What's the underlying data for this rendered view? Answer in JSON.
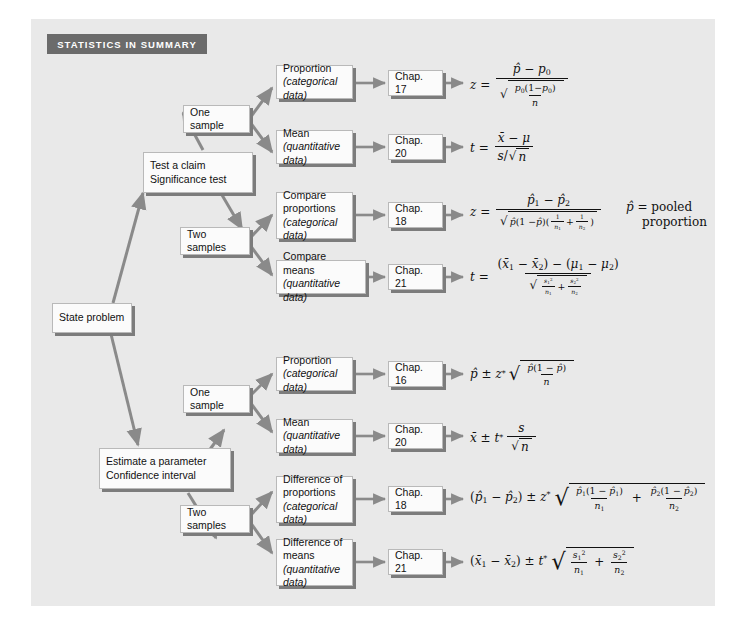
{
  "page": {
    "header_label": "STATISTICS IN SUMMARY",
    "panel_color": "#e9e9e9",
    "header_color": "#6b6b6b",
    "box_color": "#fbfbfb",
    "shadow_color": "#7c7c7c",
    "arrow_color": "#8a8a8a"
  },
  "nodes": {
    "start": {
      "line1": "State problem"
    },
    "branch_test": {
      "line1": "Test a claim",
      "line2": "Significance test"
    },
    "branch_estimate": {
      "line1": "Estimate a parameter",
      "line2": "Confidence interval"
    },
    "test_one_sample": {
      "line1": "One sample"
    },
    "test_two_samples": {
      "line1": "Two samples"
    },
    "est_one_sample": {
      "line1": "One sample"
    },
    "est_two_samples": {
      "line1": "Two samples"
    }
  },
  "rows": [
    {
      "id": "test-one-proportion",
      "label_line1": "Proportion",
      "label_line2": "(categorical data)",
      "chapter": "Chap. 17"
    },
    {
      "id": "test-one-mean",
      "label_line1": "Mean",
      "label_line2": "(quantitative data)",
      "chapter": "Chap. 20"
    },
    {
      "id": "test-two-proportions",
      "label_line1": "Compare",
      "label_line2": "proportions",
      "label_line3": "(categorical data)",
      "chapter": "Chap. 18"
    },
    {
      "id": "test-two-means",
      "label_line1": "Compare means",
      "label_line2": "(quantitative data)",
      "chapter": "Chap. 21"
    },
    {
      "id": "est-one-proportion",
      "label_line1": "Proportion",
      "label_line2": "(categorical data)",
      "chapter": "Chap. 16"
    },
    {
      "id": "est-one-mean",
      "label_line1": "Mean",
      "label_line2": "(quantitative data)",
      "chapter": "Chap. 20"
    },
    {
      "id": "est-two-proportions",
      "label_line1": "Difference of",
      "label_line2": "proportions",
      "label_line3": "(categorical data)",
      "chapter": "Chap. 18"
    },
    {
      "id": "est-two-means",
      "label_line1": "Difference of",
      "label_line2": "means",
      "label_line3": "(quantitative data)",
      "chapter": "Chap. 21"
    }
  ],
  "formulas": {
    "test_one_proportion": "z = (p-hat - p0) / sqrt( p0(1 - p0) / n )",
    "test_one_mean": "t = (x-bar - mu) / ( s / sqrt(n) )",
    "test_two_proportions": "z = (p-hat_1 - p-hat_2) / sqrt( p-hat(1 - p-hat)(1/n_1 + 1/n_2) )",
    "test_two_means": "t = ((x-bar_1 - x-bar_2) - (mu_1 - mu_2)) / sqrt( s_1^2/n_1 + s_2^2/n_2 )",
    "est_one_proportion": "p-hat +/- z* sqrt( p-hat(1 - p-hat) / n )",
    "est_one_mean": "x-bar +/- t* s / sqrt(n)",
    "est_two_proportions": "(p-hat_1 - p-hat_2) +/- z* sqrt( p-hat_1(1 - p-hat_1)/n_1 + p-hat_2(1 - p-hat_2)/n_2 )",
    "est_two_means": "(x-bar_1 - x-bar_2) +/- t* sqrt( s_1^2/n_1 + s_2^2/n_2 )"
  },
  "annotations": {
    "pooled_line1": "= pooled",
    "pooled_line2": "proportion"
  }
}
